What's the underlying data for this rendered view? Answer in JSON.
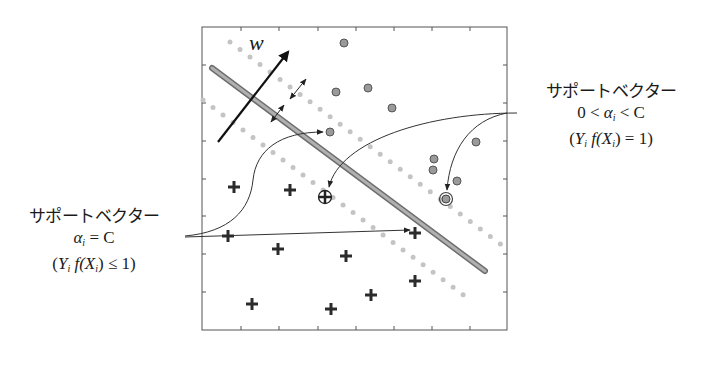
{
  "diagram": {
    "type": "svm-support-vector-illustration",
    "vector_label": "w",
    "colors": {
      "frame": "#555555",
      "hyperplane": "#8a8a8a",
      "margin_dots": "#bdbdbd",
      "circle_fill": "#9a9a9a",
      "circle_stroke": "#555555",
      "plus": "#2b2b2b",
      "arrows": "#222222"
    },
    "right_label": {
      "title": "サポートベクター",
      "condition_prefix": "0 < ",
      "alpha": "α",
      "alpha_sub": "i",
      "condition_suffix": " < C",
      "equation_open": "(",
      "Y": "Y",
      "Y_sub": "i",
      "f": " f(",
      "X": "X",
      "X_sub": "i",
      "equation_close": ") = 1)"
    },
    "left_label": {
      "title": "サポートベクター",
      "alpha": "α",
      "alpha_sub": "i",
      "condition_suffix": " = C",
      "equation_open": "(",
      "Y": "Y",
      "Y_sub": "i",
      "f": " f(",
      "X": "X",
      "X_sub": "i",
      "equation_close": ") ≤ 1)"
    },
    "circles": [
      [
        344,
        43
      ],
      [
        336,
        92
      ],
      [
        368,
        88
      ],
      [
        392,
        108
      ],
      [
        330,
        132
      ],
      [
        476,
        142
      ],
      [
        434,
        159
      ],
      [
        433,
        170
      ],
      [
        457,
        181
      ]
    ],
    "support_circle": [
      446,
      199
    ],
    "pluses": [
      [
        234,
        187
      ],
      [
        290,
        190
      ],
      [
        228,
        236
      ],
      [
        278,
        249
      ],
      [
        346,
        256
      ],
      [
        415,
        233
      ],
      [
        415,
        281
      ],
      [
        371,
        295
      ],
      [
        252,
        304
      ],
      [
        331,
        309
      ]
    ],
    "support_plus_circled": [
      325,
      197
    ]
  }
}
